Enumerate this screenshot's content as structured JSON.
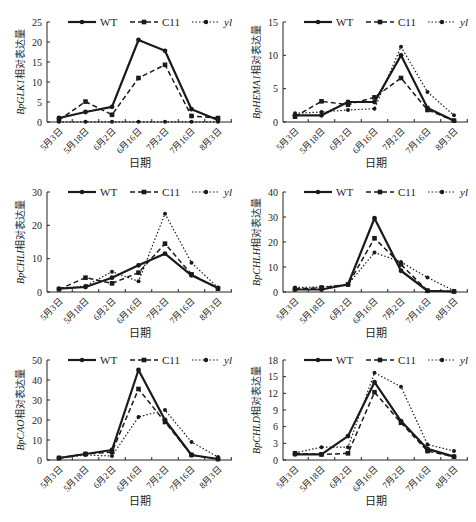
{
  "legend": [
    {
      "name": "WT",
      "style": "solid"
    },
    {
      "name": "C11",
      "style": "dashed"
    },
    {
      "name": "yl",
      "style": "dotted",
      "italic": true
    }
  ],
  "colors": {
    "line": "#1a1a1a",
    "axis": "#222222",
    "background": "#ffffff"
  },
  "chart_data": [
    {
      "type": "line",
      "gene": "BpGLK1",
      "ylabel_gene": "BpGLK1",
      "ylabel_suffix": "相对表达量",
      "xlabel": "日期",
      "categories": [
        "5月3日",
        "5月18日",
        "6月2日",
        "6月16日",
        "7月2日",
        "7月16日",
        "8月3日"
      ],
      "ylim": [
        0,
        25
      ],
      "yticks": [
        0,
        5,
        10,
        15,
        20,
        25
      ],
      "series": [
        {
          "name": "WT",
          "values": [
            1.0,
            2.5,
            3.8,
            20.5,
            17.8,
            3.2,
            0.5
          ]
        },
        {
          "name": "C11",
          "values": [
            0.5,
            5.1,
            1.8,
            11.0,
            14.3,
            1.5,
            1.0
          ]
        },
        {
          "name": "yl",
          "values": [
            0.05,
            0.05,
            0.05,
            0.05,
            0.05,
            0.05,
            0.05
          ]
        }
      ]
    },
    {
      "type": "line",
      "gene": "BpHEMA1",
      "ylabel_gene": "BpHEMA1",
      "ylabel_suffix": "相对表达量",
      "xlabel": "日期",
      "categories": [
        "5月3日",
        "5月18日",
        "6月2日",
        "6月16日",
        "7月2日",
        "7月16日",
        "8月3日"
      ],
      "ylim": [
        0,
        15
      ],
      "yticks": [
        0,
        5,
        10,
        15
      ],
      "series": [
        {
          "name": "WT",
          "values": [
            1.0,
            1.0,
            3.0,
            3.0,
            10.0,
            2.1,
            0.2
          ]
        },
        {
          "name": "C11",
          "values": [
            0.8,
            3.1,
            2.6,
            3.7,
            6.6,
            1.8,
            0.2
          ]
        },
        {
          "name": "yl",
          "values": [
            1.3,
            1.5,
            1.8,
            2.0,
            11.3,
            4.5,
            1.0
          ]
        }
      ]
    },
    {
      "type": "line",
      "gene": "BpCHLI",
      "ylabel_gene": "BpCHLI",
      "ylabel_suffix": "相对表达量",
      "xlabel": "日期",
      "categories": [
        "5月3日",
        "5月18日",
        "6月2日",
        "6月16日",
        "7月2日",
        "7月16日",
        "8月3日"
      ],
      "ylim": [
        0,
        30
      ],
      "yticks": [
        0,
        10,
        20,
        30
      ],
      "series": [
        {
          "name": "WT",
          "values": [
            1.0,
            1.5,
            4.3,
            8.0,
            11.5,
            5.0,
            1.2
          ]
        },
        {
          "name": "C11",
          "values": [
            0.8,
            4.3,
            2.6,
            5.8,
            14.5,
            5.3,
            1.0
          ]
        },
        {
          "name": "yl",
          "values": [
            1.0,
            1.8,
            6.1,
            3.2,
            23.5,
            8.8,
            1.3
          ]
        }
      ]
    },
    {
      "type": "line",
      "gene": "BpCHLH",
      "ylabel_gene": "BpCHLH",
      "ylabel_suffix": "相对表达量",
      "xlabel": "日期",
      "categories": [
        "5月3日",
        "5月18日",
        "6月2日",
        "6月16日",
        "7月2日",
        "7月16日",
        "8月3日"
      ],
      "ylim": [
        0,
        40
      ],
      "yticks": [
        0,
        10,
        20,
        30,
        40
      ],
      "series": [
        {
          "name": "WT",
          "values": [
            1.0,
            1.0,
            3.0,
            29.5,
            8.5,
            0.5,
            0.2
          ]
        },
        {
          "name": "C11",
          "values": [
            1.2,
            1.7,
            3.0,
            21.5,
            11.0,
            0.5,
            0.2
          ]
        },
        {
          "name": "yl",
          "values": [
            1.8,
            2.0,
            3.0,
            15.8,
            12.0,
            5.8,
            0.5
          ]
        }
      ]
    },
    {
      "type": "line",
      "gene": "BpCAO",
      "ylabel_gene": "BpCAO",
      "ylabel_suffix": "相对表达量",
      "xlabel": "日期",
      "categories": [
        "5月3日",
        "5月18日",
        "6月2日",
        "6月16日",
        "7月2日",
        "7月16日",
        "8月3日"
      ],
      "ylim": [
        0,
        50
      ],
      "yticks": [
        0,
        10,
        20,
        30,
        40,
        50
      ],
      "series": [
        {
          "name": "WT",
          "values": [
            1.0,
            3.0,
            5.0,
            45.0,
            20.0,
            2.5,
            0.5
          ]
        },
        {
          "name": "C11",
          "values": [
            1.0,
            3.0,
            4.0,
            35.5,
            19.0,
            2.5,
            0.5
          ]
        },
        {
          "name": "yl",
          "values": [
            1.0,
            2.5,
            2.0,
            21.5,
            25.0,
            9.0,
            1.5
          ]
        }
      ]
    },
    {
      "type": "line",
      "gene": "BpCHLD",
      "ylabel_gene": "BpCHLD",
      "ylabel_suffix": "相对表达量",
      "xlabel": "日期",
      "categories": [
        "5月3日",
        "5月18日",
        "6月2日",
        "6月16日",
        "7月2日",
        "7月16日",
        "8月3日"
      ],
      "ylim": [
        0,
        18
      ],
      "yticks": [
        0,
        3,
        6,
        9,
        12,
        15,
        18
      ],
      "series": [
        {
          "name": "WT",
          "values": [
            1.0,
            1.0,
            4.3,
            14.0,
            7.0,
            2.0,
            0.6
          ]
        },
        {
          "name": "C11",
          "values": [
            1.2,
            1.0,
            1.2,
            12.2,
            6.7,
            1.6,
            0.6
          ]
        },
        {
          "name": "yl",
          "values": [
            1.3,
            2.3,
            2.3,
            15.7,
            13.2,
            2.8,
            1.6
          ]
        }
      ]
    }
  ]
}
